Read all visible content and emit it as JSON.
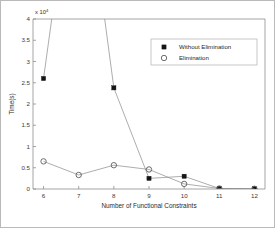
{
  "figure": {
    "border_color": "#b9b9b9",
    "background": "#ffffff"
  },
  "chart_data": {
    "type": "line",
    "title": "",
    "subtitle": "",
    "xlabel": "Number of Functional Constraints",
    "ylabel": "Time(s)",
    "y_multiplier_label": "x 10",
    "y_multiplier_exponent": "4",
    "x": [
      6,
      7,
      8,
      9,
      10,
      11,
      12
    ],
    "xlim": [
      5.7,
      12.3
    ],
    "ylim": [
      0,
      4
    ],
    "xticks": [
      "6",
      "7",
      "8",
      "9",
      "10",
      "11",
      "12"
    ],
    "yticks": [
      "0",
      "0.5",
      "1",
      "1.5",
      "2",
      "2.5",
      "3",
      "3.5",
      "4"
    ],
    "grid": false,
    "legend_position": "upper right",
    "series": [
      {
        "name": "Without Elimination",
        "marker": "filled-square",
        "marker_color": "#141414",
        "line_color": "#8a8a8a",
        "values": [
          2.6,
          8.6,
          2.38,
          0.25,
          0.3,
          0.012,
          0.005
        ],
        "clipped_above_ylim": [
          false,
          true,
          false,
          false,
          false,
          false,
          false
        ]
      },
      {
        "name": "Elimination",
        "marker": "open-circle",
        "marker_color": "#5e5e5e",
        "line_color": "#8a8a8a",
        "values": [
          0.65,
          0.33,
          0.56,
          0.46,
          0.12,
          0.012,
          0.005
        ],
        "clipped_above_ylim": [
          false,
          false,
          false,
          false,
          false,
          false,
          false
        ]
      }
    ],
    "legend": [
      {
        "label": "Without Elimination",
        "marker": "filled-square"
      },
      {
        "label": "Elimination",
        "marker": "open-circle"
      }
    ]
  }
}
